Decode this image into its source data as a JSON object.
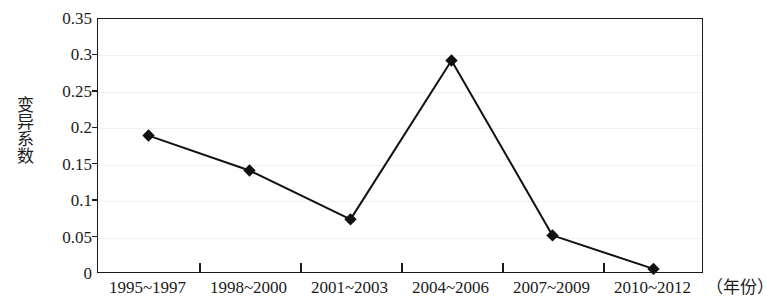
{
  "chart_data": {
    "type": "line",
    "title": "",
    "subtitle": "",
    "xlabel": "（年份）",
    "ylabel": "变异系数",
    "categories": [
      "1995~1997",
      "1998~2000",
      "2001~2003",
      "2004~2006",
      "2007~2009",
      "2010~2012"
    ],
    "values": [
      0.19,
      0.142,
      0.075,
      0.293,
      0.053,
      0.007
    ],
    "series": [
      {
        "name": "变异系数",
        "values": [
          0.19,
          0.142,
          0.075,
          0.293,
          0.053,
          0.007
        ]
      }
    ],
    "ylim": [
      0,
      0.35
    ],
    "ytick_values": [
      0,
      0.05,
      0.1,
      0.15,
      0.2,
      0.25,
      0.3,
      0.35
    ],
    "ytick_labels": [
      "0",
      "0.05",
      "0.1",
      "0.15",
      "0.2",
      "0.25",
      "0.3",
      "0.35"
    ],
    "grid": true,
    "grid_axis": "y",
    "legend": false,
    "legend_position": "none",
    "marker": "diamond",
    "line_color": "#111111",
    "marker_color": "#111111",
    "grid_color": "#eef0f2",
    "axis_color": "#1b1b1b",
    "background_color": "#ffffff",
    "annotations": []
  }
}
